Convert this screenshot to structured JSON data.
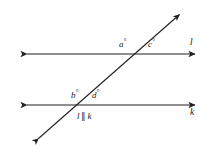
{
  "figure": {
    "background_color": "#ffffff",
    "stroke_color": "#231f20"
  },
  "lines": {
    "upper": {
      "name": "l",
      "label": "l",
      "y": 54,
      "x_start": 26,
      "x_end": 196,
      "arrow_start": true,
      "arrow_end": true
    },
    "lower": {
      "name": "k",
      "label": "k",
      "y": 105,
      "x_start": 26,
      "x_end": 196,
      "arrow_start": true,
      "arrow_end": true
    },
    "transversal": {
      "name": "transversal",
      "x_start": 37,
      "y_start": 140,
      "x_end": 181,
      "y_end": 13,
      "arrow_start": true,
      "arrow_end": true
    }
  },
  "angles": [
    {
      "id": "a",
      "letter": "a",
      "degree_symbol": "°",
      "position": "upper-intersection-left-above"
    },
    {
      "id": "c",
      "letter": "c",
      "degree_symbol": "°",
      "position": "upper-intersection-right-above"
    },
    {
      "id": "b",
      "letter": "b",
      "degree_symbol": "°",
      "position": "lower-intersection-left-above"
    },
    {
      "id": "d",
      "letter": "d",
      "degree_symbol": "°",
      "position": "lower-intersection-right-above"
    }
  ],
  "parallel_statement": {
    "left": "l",
    "symbol": "∥",
    "right": "k"
  }
}
